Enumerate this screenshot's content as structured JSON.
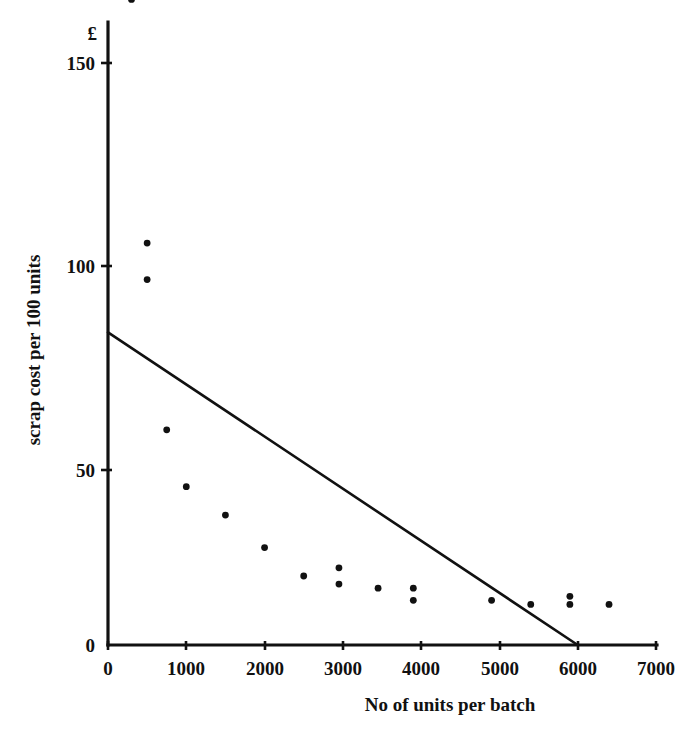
{
  "chart_data": {
    "type": "scatter",
    "title": "",
    "subtitle": "",
    "xlabel": "No of units per batch",
    "ylabel": "scrap cost per 100 units",
    "y_unit_symbol": "£",
    "xlim": [
      0,
      7000
    ],
    "ylim": [
      0,
      160
    ],
    "xticks": [
      0,
      1000,
      2000,
      3000,
      4000,
      5000,
      6000,
      7000
    ],
    "xtick_labels": [
      "0",
      "1000",
      "2000",
      "3000",
      "4000",
      "5000",
      "6000",
      "7000"
    ],
    "yticks": [
      0,
      50,
      100,
      150
    ],
    "ytick_labels": [
      "0",
      "50",
      "100",
      "150"
    ],
    "grid": false,
    "legend": null,
    "legend_position": "none",
    "marker": "filled-circle",
    "marker_color": "#111111",
    "axis_color": "#111111",
    "background_color": "#ffffff",
    "points": [
      {
        "x": 300,
        "y": 159
      },
      {
        "x": 500,
        "y": 99
      },
      {
        "x": 500,
        "y": 90
      },
      {
        "x": 750,
        "y": 53
      },
      {
        "x": 1000,
        "y": 39
      },
      {
        "x": 1500,
        "y": 32
      },
      {
        "x": 2000,
        "y": 24
      },
      {
        "x": 2500,
        "y": 17
      },
      {
        "x": 2950,
        "y": 19
      },
      {
        "x": 2950,
        "y": 15
      },
      {
        "x": 3450,
        "y": 14
      },
      {
        "x": 3900,
        "y": 14
      },
      {
        "x": 3900,
        "y": 11
      },
      {
        "x": 4900,
        "y": 11
      },
      {
        "x": 5400,
        "y": 10
      },
      {
        "x": 5900,
        "y": 12
      },
      {
        "x": 5900,
        "y": 10
      },
      {
        "x": 6400,
        "y": 10
      }
    ],
    "trend_line": {
      "label": "fitted straight line",
      "points": [
        {
          "x": 0,
          "y": 77
        },
        {
          "x": 6000,
          "y": 0
        }
      ],
      "intercept": 77,
      "slope_per_1000_units": -12.8
    }
  }
}
